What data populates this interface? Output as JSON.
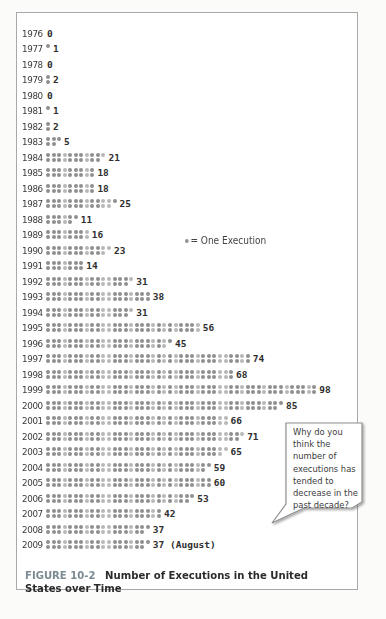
{
  "chart_data": {
    "type": "pictograph",
    "title": "Number of Executions in the United States over Time",
    "figure_label": "FIGURE 10-2",
    "unit": "One Execution",
    "xlabel": "",
    "ylabel": "",
    "orientation": "horizontal",
    "categories": [
      "1976",
      "1977",
      "1978",
      "1979",
      "1980",
      "1981",
      "1982",
      "1983",
      "1984",
      "1985",
      "1986",
      "1987",
      "1988",
      "1989",
      "1990",
      "1991",
      "1992",
      "1993",
      "1994",
      "1995",
      "1996",
      "1997",
      "1998",
      "1999",
      "2000",
      "2001",
      "2002",
      "2003",
      "2004",
      "2005",
      "2006",
      "2007",
      "2008",
      "2009"
    ],
    "values": [
      0,
      1,
      0,
      2,
      0,
      1,
      2,
      5,
      21,
      18,
      18,
      25,
      11,
      16,
      23,
      14,
      31,
      38,
      31,
      56,
      45,
      74,
      68,
      98,
      85,
      66,
      71,
      65,
      59,
      60,
      53,
      42,
      37,
      37
    ],
    "value_labels": [
      "0",
      "1",
      "0",
      "2",
      "0",
      "1",
      "2",
      "5",
      "21",
      "18",
      "18",
      "25",
      "11",
      "16",
      "23",
      "14",
      "31",
      "38",
      "31",
      "56",
      "45",
      "74",
      "68",
      "98",
      "85",
      "66",
      "71",
      "65",
      "59",
      "60",
      "53",
      "42",
      "37",
      "37 (August)"
    ],
    "annotations": [
      "2009 value through August"
    ]
  },
  "legend": {
    "label": "= One Execution"
  },
  "caption": {
    "figure_label": "FIGURE 10-2",
    "title": "Number of Executions in the United States over Time"
  },
  "callout": {
    "text": "Why do you think the number of executions has tended to decrease in the past decade?"
  },
  "colors": {
    "dot": "#8f8f8f",
    "dot_light": "#b8b8b8",
    "figure_label": "#7b8a93",
    "frame_border": "#a9a9a9"
  }
}
